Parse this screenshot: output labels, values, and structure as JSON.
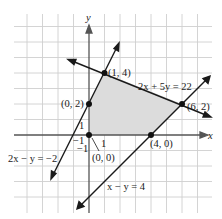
{
  "diagram": {
    "type": "feasible-region-graph",
    "axes": {
      "x_label": "x",
      "y_label": "y",
      "tick_labels": {
        "x_pos": "1",
        "x_neg": "−1",
        "y_pos": "1",
        "y_neg": "−1"
      }
    },
    "grid": {
      "origin_px": [
        89,
        135
      ],
      "unit_px": 15.5,
      "x_range": [
        -5,
        8
      ],
      "y_range": [
        -5,
        7
      ]
    },
    "colors": {
      "grid": "#c8c8c8",
      "axis": "#555555",
      "line": "#1a1a1a",
      "region": "#dcdcdc"
    },
    "lines": [
      {
        "equation": "2x + 5y = 22",
        "label": "2x + 5y = 22"
      },
      {
        "equation": "2x − y = −2",
        "label": "2x − y = −2"
      },
      {
        "equation": "x − y = 4",
        "label": "x − y = 4"
      }
    ],
    "vertices": [
      {
        "label": "(0, 0)",
        "x": 0,
        "y": 0
      },
      {
        "label": "(0, 2)",
        "x": 0,
        "y": 2
      },
      {
        "label": "(1, 4)",
        "x": 1,
        "y": 4
      },
      {
        "label": "(6, 2)",
        "x": 6,
        "y": 2
      },
      {
        "label": "(4, 0)",
        "x": 4,
        "y": 0
      }
    ],
    "shaded_region": "polygon (0,0)-(0,2)-(1,4)-(6,2)-(4,0)"
  }
}
